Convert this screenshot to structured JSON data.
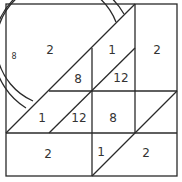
{
  "diagram": {
    "colors": {
      "line": "#2a2a2a",
      "text": "#333333",
      "background": "#ffffff"
    },
    "labels": [
      {
        "id": "circle-region",
        "value": "2"
      },
      {
        "id": "ring-label",
        "value": "8"
      },
      {
        "id": "upper-middle-triangle",
        "value": "8"
      },
      {
        "id": "upper-right-triangle-top",
        "value": "1"
      },
      {
        "id": "upper-right-triangle-bottom",
        "value": "12"
      },
      {
        "id": "right-column",
        "value": "2"
      },
      {
        "id": "mid-left-triangle",
        "value": "1"
      },
      {
        "id": "mid-center-triangle",
        "value": "12"
      },
      {
        "id": "center-square",
        "value": "8"
      },
      {
        "id": "bottom-left-rect",
        "value": "2"
      },
      {
        "id": "bottom-middle-triangle",
        "value": "1"
      },
      {
        "id": "bottom-right-triangle",
        "value": "2"
      }
    ]
  }
}
